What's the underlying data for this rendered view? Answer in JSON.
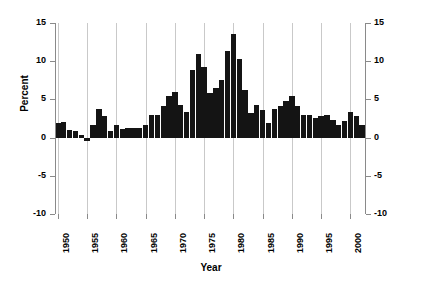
{
  "chart_data": {
    "type": "bar",
    "title": "",
    "subtitle": "",
    "xlabel": "Year",
    "ylabel": "Percent",
    "xlim": [
      1949.5,
      2002.5
    ],
    "ylim": [
      -10,
      15
    ],
    "grid": "vertical gridlines at each labeled 5-year tick",
    "legend": "none",
    "bar_color": "#141414",
    "y_ticks": [
      15,
      10,
      5,
      0,
      -5,
      -10
    ],
    "y_tick_labels": [
      "15",
      "10",
      "5",
      "0",
      "-5",
      "-10"
    ],
    "y_axis_both_sides": true,
    "x_ticks": [
      1950,
      1955,
      1960,
      1965,
      1970,
      1975,
      1980,
      1985,
      1990,
      1995,
      2000
    ],
    "x_tick_labels": [
      "1950",
      "1955",
      "1960",
      "1965",
      "1970",
      "1975",
      "1980",
      "1985",
      "1990",
      "1995",
      "2000"
    ],
    "x_tick_rotation": 90,
    "categories": [
      1950,
      1951,
      1952,
      1953,
      1954,
      1955,
      1956,
      1957,
      1958,
      1959,
      1960,
      1961,
      1962,
      1963,
      1964,
      1965,
      1966,
      1967,
      1968,
      1969,
      1970,
      1971,
      1972,
      1973,
      1974,
      1975,
      1976,
      1977,
      1978,
      1979,
      1980,
      1981,
      1982,
      1983,
      1984,
      1985,
      1986,
      1987,
      1988,
      1989,
      1990,
      1991,
      1992,
      1993,
      1994,
      1995,
      1996,
      1997,
      1998,
      1999,
      2000,
      2001,
      2002
    ],
    "values": [
      1.9,
      2.1,
      1.0,
      0.8,
      0.3,
      -0.4,
      1.6,
      3.7,
      2.8,
      0.8,
      1.7,
      1.1,
      1.2,
      1.3,
      1.3,
      1.7,
      3.0,
      3.0,
      4.2,
      5.5,
      6.0,
      4.3,
      3.4,
      8.8,
      11.0,
      9.2,
      5.8,
      6.5,
      7.6,
      11.3,
      13.5,
      10.3,
      6.2,
      3.2,
      4.3,
      3.6,
      1.9,
      3.7,
      4.1,
      4.8,
      5.4,
      4.2,
      3.0,
      3.0,
      2.6,
      2.8,
      3.0,
      2.3,
      1.6,
      2.2,
      3.4,
      2.8,
      1.6
    ],
    "series": [
      {
        "name": "Percent",
        "values": [
          1.9,
          2.1,
          1.0,
          0.8,
          0.3,
          -0.4,
          1.6,
          3.7,
          2.8,
          0.8,
          1.7,
          1.1,
          1.2,
          1.3,
          1.3,
          1.7,
          3.0,
          3.0,
          4.2,
          5.5,
          6.0,
          4.3,
          3.4,
          8.8,
          11.0,
          9.2,
          5.8,
          6.5,
          7.6,
          11.3,
          13.5,
          10.3,
          6.2,
          3.2,
          4.3,
          3.6,
          1.9,
          3.7,
          4.1,
          4.8,
          5.4,
          4.2,
          3.0,
          3.0,
          2.6,
          2.8,
          3.0,
          2.3,
          1.6,
          2.2,
          3.4,
          2.8,
          1.6
        ]
      }
    ]
  }
}
